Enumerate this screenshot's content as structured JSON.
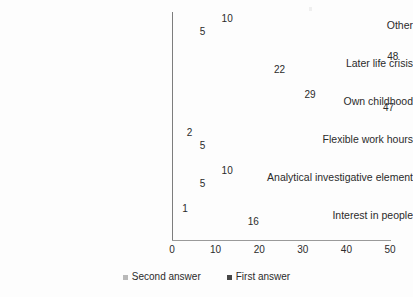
{
  "chart_data": {
    "type": "bar",
    "orientation": "horizontal",
    "title": "",
    "xlabel": "",
    "ylabel": "",
    "xlim": [
      0,
      50
    ],
    "xticks": [
      0,
      10,
      20,
      30,
      40,
      50
    ],
    "grid": false,
    "legend_position": "bottom-center",
    "categories": [
      "Other",
      "Later life crisis",
      "Own childhood",
      "Flexible work hours",
      "Analytical investigative element",
      "Interest in people"
    ],
    "series": [
      {
        "name": "Second answer",
        "color": "#b9b9b9",
        "values": [
          10,
          48,
          29,
          2,
          10,
          1
        ]
      },
      {
        "name": "First answer",
        "color": "#474747",
        "values": [
          5,
          22,
          47,
          5,
          5,
          16
        ]
      }
    ]
  },
  "axis": {
    "ticks": [
      "0",
      "10",
      "20",
      "30",
      "40",
      "50"
    ]
  },
  "legend": {
    "items": [
      {
        "label": "Second answer",
        "marker": "square-light"
      },
      {
        "label": "First answer",
        "marker": "square-dark"
      }
    ]
  }
}
